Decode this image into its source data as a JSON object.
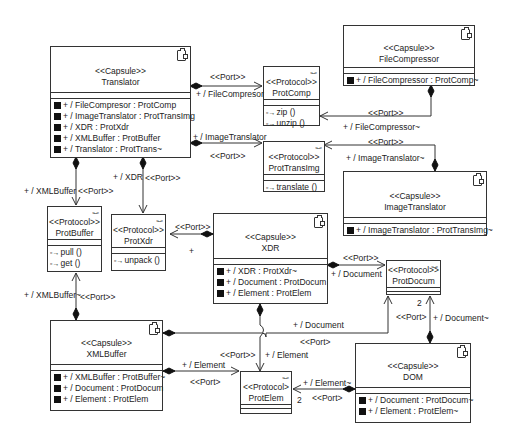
{
  "diagram": {
    "type": "UML capsule structure diagram",
    "capsules": {
      "translator": {
        "stereotype": "<<Capsule>>",
        "name": "Translator",
        "ports": [
          "+ / FileCompresor : ProtComp",
          "+ / ImageTranslator : ProtTransImg",
          "+ / XDR : ProtXdr",
          "+ / XMLBuffer : ProtBuffer",
          "+ / Translator : ProtTrans~"
        ]
      },
      "file_compressor": {
        "stereotype": "<<Capsule>>",
        "name": "FileCompressor",
        "ports": [
          "+ / FileCompressor : ProtComp~"
        ]
      },
      "image_translator": {
        "stereotype": "<<Capsule>>",
        "name": "ImageTranslator",
        "ports": [
          "+ / ImageTranslator : ProtTransImg~"
        ]
      },
      "xdr": {
        "stereotype": "<<Capsule>>",
        "name": "XDR",
        "ports": [
          "+ / XDR : ProtXdr~",
          "+ / Document : ProtDocum",
          "+ / Element : ProtElem"
        ]
      },
      "xml_buffer": {
        "stereotype": "<<Capsule>>",
        "name": "XMLBuffer",
        "ports": [
          "+ / XMLBuffer : ProtBuffer~",
          "+ / Document : ProtDocum",
          "+ / Element : ProtElem"
        ]
      },
      "dom": {
        "stereotype": "<<Capsule>>",
        "name": "DOM",
        "ports": [
          "+ / Document : ProtDocum~",
          "+ / Element : ProtElem~"
        ]
      }
    },
    "protocols": {
      "prot_comp": {
        "stereotype": "<<Protocol>>",
        "name": "ProtComp",
        "ops": [
          "zip ()",
          "unzip ()"
        ]
      },
      "prot_trans_img": {
        "stereotype": "<<Protocol>>",
        "name": "ProtTransImg",
        "ops": [
          "translate ()"
        ]
      },
      "prot_buffer": {
        "stereotype": "<<Protocol>>",
        "name": "ProtBuffer",
        "ops": [
          "pull ()",
          "get ()"
        ]
      },
      "prot_xdr": {
        "stereotype": "<<Protocol>>",
        "name": "ProtXdr",
        "ops": [
          "unpack ()"
        ]
      },
      "prot_docum": {
        "stereotype": "<<Protocol>>",
        "name": "ProtDocum",
        "ops": []
      },
      "prot_elem": {
        "stereotype": "<<Protocol>",
        "name": "ProtElem",
        "ops": []
      }
    },
    "op_prefix": "+",
    "labels": {
      "port": "<<Port>>",
      "port_alt": "<<Port>",
      "file_compresor": "+ / FileCompresor",
      "file_compressor_conj": "+ / FileCompressor~",
      "image_translator": "+ / ImageTranslator",
      "image_translator_conj": "+ / ImageTranslator~",
      "xdr": "+ / XDR",
      "xml_buffer": "+ / XMLBuffer",
      "xml_buffer_conj": "+ / XMLBuffer~",
      "plus": "+",
      "document": "+ / Document",
      "document_conj": "+ / Document~",
      "element": "+ / Element",
      "element_conj": "+ / Element~",
      "multiplicity_2": "2"
    }
  }
}
